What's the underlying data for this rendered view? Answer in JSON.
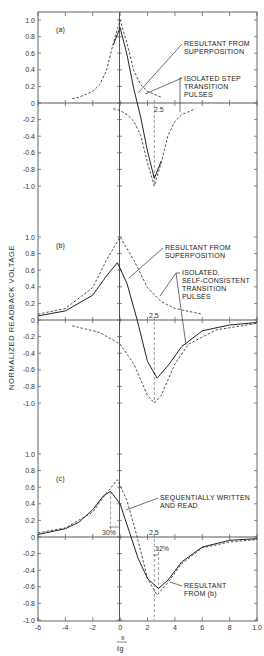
{
  "chart_data": {
    "type": "line",
    "ylabel": "NORMALIZED READBACK VOLTAGE",
    "xlabel": "x / ℓg",
    "xlim": [
      -6,
      10
    ],
    "xticks": [
      -6,
      -4,
      -2,
      0,
      2,
      4,
      6,
      8,
      10
    ],
    "xtick_labels": [
      "-6",
      "-4",
      "-2",
      "0",
      "2",
      "4",
      "6",
      "8",
      "1.0"
    ],
    "yticks": [
      1.0,
      0.8,
      0.6,
      0.4,
      0.2,
      0,
      -0.2,
      -0.4,
      -0.6,
      -0.8,
      -1.0
    ],
    "ytick_labels": [
      "1.0",
      "0.8",
      "0.6",
      "0.4",
      "0.2",
      "0",
      "-0.2",
      "-0.4",
      "-0.6",
      "-0.8",
      "-1.0"
    ],
    "panels": [
      {
        "label": "(a)",
        "ylim": [
          -1.0,
          1.0
        ],
        "marker_label": "2.5",
        "series": [
          {
            "name": "Isolated step transition pulses (positive)",
            "style": "dashed",
            "x": [
              -3.5,
              -3,
              -2,
              -1.5,
              -1,
              -0.5,
              0,
              0.5,
              1,
              1.5,
              2,
              3
            ],
            "y": [
              0.05,
              0.07,
              0.14,
              0.22,
              0.39,
              0.72,
              1.0,
              0.72,
              0.39,
              0.22,
              0.14,
              0.07
            ]
          },
          {
            "name": "Isolated step transition pulses (negative)",
            "style": "dashed",
            "x": [
              -0.5,
              0,
              0.5,
              1,
              1.5,
              2,
              2.5,
              3,
              3.5,
              4,
              4.5,
              5.5
            ],
            "y": [
              -0.07,
              -0.09,
              -0.14,
              -0.22,
              -0.39,
              -0.72,
              -1.0,
              -0.72,
              -0.39,
              -0.22,
              -0.14,
              -0.07
            ]
          },
          {
            "name": "Resultant from superposition",
            "style": "solid",
            "x": [
              -0.5,
              0,
              0.5,
              1,
              1.5,
              2,
              2.5,
              3
            ],
            "y": [
              0.7,
              0.91,
              0.58,
              0.17,
              -0.17,
              -0.58,
              -0.91,
              -0.7
            ]
          }
        ],
        "annotations": [
          "RESULTANT FROM SUPERPOSITION",
          "ISOLATED STEP TRANSITION PULSES"
        ]
      },
      {
        "label": "(b)",
        "ylim": [
          -1.0,
          1.0
        ],
        "marker_label": "2.5",
        "series": [
          {
            "name": "Isolated self-consistent transition pulses (positive)",
            "style": "dashed",
            "x": [
              -6,
              -4,
              -2,
              -1,
              0,
              1,
              2,
              3,
              4,
              6
            ],
            "y": [
              0.07,
              0.14,
              0.39,
              0.72,
              1.0,
              0.72,
              0.39,
              0.22,
              0.14,
              0.07
            ]
          },
          {
            "name": "Isolated self-consistent transition pulses (negative)",
            "style": "dashed",
            "x": [
              -3.5,
              -1.5,
              0,
              1,
              2,
              2.5,
              3,
              4,
              5,
              7,
              10
            ],
            "y": [
              -0.07,
              -0.15,
              -0.29,
              -0.53,
              -0.91,
              -1.0,
              -0.91,
              -0.53,
              -0.29,
              -0.12,
              -0.04
            ]
          },
          {
            "name": "Resultant from superposition",
            "style": "solid",
            "x": [
              -6,
              -4,
              -2,
              -1,
              -0.2,
              0.5,
              1.25,
              2,
              2.7,
              3.5,
              4.5,
              6,
              8,
              10
            ],
            "y": [
              0.05,
              0.11,
              0.3,
              0.53,
              0.69,
              0.44,
              0.0,
              -0.5,
              -0.7,
              -0.55,
              -0.32,
              -0.13,
              -0.06,
              -0.03
            ]
          }
        ],
        "annotations": [
          "RESULTANT FROM SUPERPOSITION",
          "ISOLATED, SELF-CONSISTENT TRANSITION PULSES"
        ]
      },
      {
        "label": "(c)",
        "ylim": [
          -1.0,
          1.0
        ],
        "marker_label": "2.5",
        "shift_labels": [
          "30%",
          "12%"
        ],
        "series": [
          {
            "name": "Sequentially written and read",
            "style": "solid",
            "x": [
              -6,
              -4,
              -3,
              -2,
              -1.2,
              -0.7,
              0,
              0.7,
              1.3,
              2,
              2.8,
              3.5,
              4.5,
              6,
              8,
              10
            ],
            "y": [
              0.03,
              0.1,
              0.18,
              0.33,
              0.5,
              0.55,
              0.4,
              0.05,
              -0.25,
              -0.5,
              -0.62,
              -0.52,
              -0.3,
              -0.12,
              -0.04,
              -0.02
            ]
          },
          {
            "name": "Resultant from (b)",
            "style": "dashed",
            "x": [
              -6,
              -4,
              -2,
              -1,
              -0.2,
              0.5,
              1.25,
              2,
              2.7,
              3.5,
              4.5,
              6,
              8,
              10
            ],
            "y": [
              0.05,
              0.11,
              0.3,
              0.53,
              0.69,
              0.44,
              0.0,
              -0.5,
              -0.7,
              -0.55,
              -0.32,
              -0.13,
              -0.06,
              -0.03
            ]
          }
        ],
        "annotations": [
          "SEQUENTIALLY WRITTEN AND READ",
          "RESULTANT FROM (b)"
        ]
      }
    ]
  },
  "labels": {
    "panel_a": "(a)",
    "panel_b": "(b)",
    "panel_c": "(c)",
    "marker": "2.5",
    "a_resultant_1": "RESULTANT FROM",
    "a_resultant_2": "SUPERPOSITION",
    "a_isolated_1": "ISOLATED STEP",
    "a_isolated_2": "TRANSITION",
    "a_isolated_3": "PULSES",
    "b_resultant_1": "RESULTANT FROM",
    "b_resultant_2": "SUPERPOSITION",
    "b_isolated_1": "ISOLATED,",
    "b_isolated_2": "SELF-CONSISTENT",
    "b_isolated_3": "TRANSITION",
    "b_isolated_4": "PULSES",
    "c_seq_1": "SEQUENTIALLY WRITTEN",
    "c_seq_2": "AND READ",
    "c_res_1": "RESULTANT",
    "c_res_2": "FROM (b)",
    "c_shift_left": "30%",
    "c_shift_right": "12%",
    "ylabel": "NORMALIZED READBACK VOLTAGE",
    "xlabel_num": "x",
    "xlabel_den": "ℓg"
  }
}
